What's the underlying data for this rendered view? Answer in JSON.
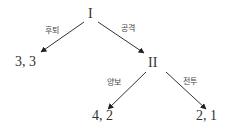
{
  "diagram": {
    "type": "game-tree",
    "nodes": [
      {
        "id": "root",
        "label": "I"
      },
      {
        "id": "player2",
        "label": "II"
      },
      {
        "id": "payoff_retreat",
        "label": "3, 3"
      },
      {
        "id": "payoff_yield",
        "label": "4, 2"
      },
      {
        "id": "payoff_fight",
        "label": "2, 1"
      }
    ],
    "edges": [
      {
        "from": "root",
        "to": "payoff_retreat",
        "label": "후퇴"
      },
      {
        "from": "root",
        "to": "player2",
        "label": "공격"
      },
      {
        "from": "player2",
        "to": "payoff_yield",
        "label": "양보"
      },
      {
        "from": "player2",
        "to": "payoff_fight",
        "label": "전투"
      }
    ],
    "colors": {
      "line": "#333333",
      "text": "#333333"
    }
  }
}
